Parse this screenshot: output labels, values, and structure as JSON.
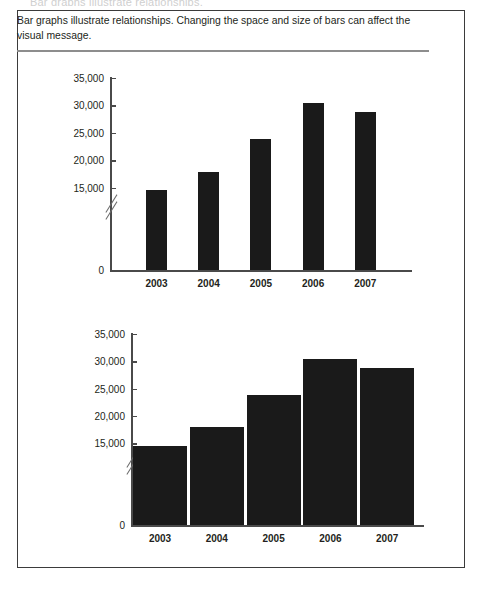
{
  "document": {
    "top_cut_text": "Bar graphs illustrate relationships.",
    "caption": "Bar graphs illustrate relationships. Changing the space and size of bars can affect the visual message."
  },
  "colors": {
    "bar": "#1a1a1a",
    "axis": "#4a4a4a",
    "border": "#3b3b3b",
    "rule": "#8d8d8d",
    "text": "#231f20",
    "background": "#ffffff"
  },
  "chart_data": [
    {
      "type": "bar",
      "title": "",
      "xlabel": "",
      "ylabel": "",
      "categories": [
        "2003",
        "2004",
        "2005",
        "2006",
        "2007"
      ],
      "values": [
        14500,
        17900,
        23800,
        30400,
        28800
      ],
      "ytick_labels": [
        "0",
        "15,000",
        "20,000",
        "25,000",
        "30,000",
        "35,000"
      ],
      "ytick_values": [
        0,
        15000,
        20000,
        25000,
        30000,
        35000
      ],
      "ylim": [
        0,
        35000
      ],
      "axis_break": true,
      "axis_break_between": [
        0,
        15000
      ],
      "grid": false,
      "legend": "none",
      "bar_style": "narrow-bars-wide-gaps"
    },
    {
      "type": "bar",
      "title": "",
      "xlabel": "",
      "ylabel": "",
      "categories": [
        "2003",
        "2004",
        "2005",
        "2006",
        "2007"
      ],
      "values": [
        14500,
        17900,
        23800,
        30400,
        28800
      ],
      "ytick_labels": [
        "0",
        "15,000",
        "20,000",
        "25,000",
        "30,000",
        "35,000"
      ],
      "ytick_values": [
        0,
        15000,
        20000,
        25000,
        30000,
        35000
      ],
      "ylim": [
        0,
        35000
      ],
      "axis_break": true,
      "axis_break_between": [
        0,
        15000
      ],
      "grid": false,
      "legend": "none",
      "bar_style": "wide-bars-no-gaps"
    }
  ]
}
